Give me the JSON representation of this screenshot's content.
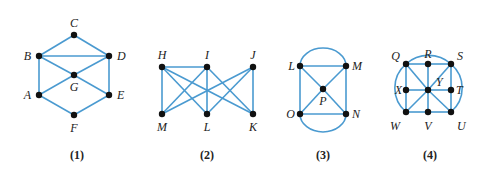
{
  "figure": {
    "edge_color": "#4a9ad0",
    "node_color": "#111111",
    "graphs": [
      {
        "caption": "(1)",
        "vertices": [
          "A",
          "B",
          "C",
          "D",
          "E",
          "F",
          "G"
        ],
        "edges": [
          [
            "C",
            "B"
          ],
          [
            "C",
            "D"
          ],
          [
            "B",
            "D"
          ],
          [
            "B",
            "A"
          ],
          [
            "D",
            "E"
          ],
          [
            "B",
            "G"
          ],
          [
            "G",
            "E"
          ],
          [
            "D",
            "G"
          ],
          [
            "G",
            "A"
          ],
          [
            "A",
            "F"
          ],
          [
            "E",
            "F"
          ]
        ],
        "arcs": []
      },
      {
        "caption": "(2)",
        "vertices": [
          "H",
          "I",
          "J",
          "M",
          "L",
          "K"
        ],
        "edges": [
          [
            "H",
            "I"
          ],
          [
            "H",
            "M"
          ],
          [
            "H",
            "L"
          ],
          [
            "H",
            "K"
          ],
          [
            "I",
            "M"
          ],
          [
            "I",
            "L"
          ],
          [
            "I",
            "K"
          ],
          [
            "J",
            "M"
          ],
          [
            "J",
            "L"
          ],
          [
            "J",
            "K"
          ]
        ],
        "arcs": []
      },
      {
        "caption": "(3)",
        "vertices": [
          "L",
          "M",
          "P",
          "O",
          "N"
        ],
        "edges": [
          [
            "L",
            "M"
          ],
          [
            "L",
            "O"
          ],
          [
            "M",
            "N"
          ],
          [
            "O",
            "N"
          ],
          [
            "L",
            "P"
          ],
          [
            "P",
            "N"
          ],
          [
            "M",
            "P"
          ],
          [
            "P",
            "O"
          ]
        ],
        "arcs": [
          [
            "L",
            "M"
          ],
          [
            "O",
            "N"
          ]
        ]
      },
      {
        "caption": "(4)",
        "vertices": [
          "Q",
          "R",
          "S",
          "X",
          "Y",
          "T",
          "W",
          "V",
          "U"
        ],
        "edges": [
          [
            "Q",
            "R"
          ],
          [
            "R",
            "S"
          ],
          [
            "Q",
            "X"
          ],
          [
            "X",
            "W"
          ],
          [
            "S",
            "T"
          ],
          [
            "T",
            "U"
          ],
          [
            "W",
            "V"
          ],
          [
            "V",
            "U"
          ],
          [
            "R",
            "Y"
          ],
          [
            "Y",
            "V"
          ],
          [
            "X",
            "Y"
          ],
          [
            "Y",
            "T"
          ],
          [
            "Q",
            "Y"
          ],
          [
            "Y",
            "U"
          ],
          [
            "S",
            "Y"
          ],
          [
            "Y",
            "W"
          ]
        ],
        "arcs": [
          [
            "Q",
            "S"
          ],
          [
            "Q",
            "W"
          ],
          [
            "S",
            "U"
          ]
        ]
      }
    ]
  }
}
